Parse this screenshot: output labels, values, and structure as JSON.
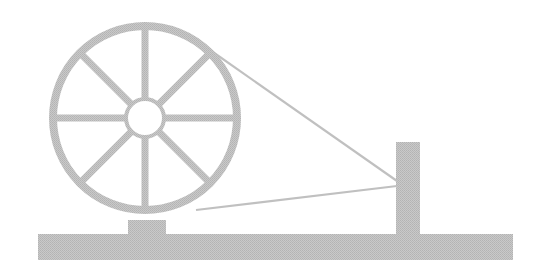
{
  "illustration": {
    "subject": "spinning wheel (charkha)",
    "colors": {
      "background": "#ffffff",
      "stroke": "#c4c4c4",
      "fill": "#bdbdbd",
      "hub_fill": "#ffffff"
    },
    "wheel": {
      "cx": 145,
      "cy": 118,
      "r": 92,
      "ring_width": 8,
      "hub_r": 19,
      "spokes": 8
    },
    "pedestal": {
      "x": 128,
      "y": 222,
      "w": 38,
      "h": 14
    },
    "base": {
      "x": 38,
      "y": 234,
      "w": 475,
      "h": 26
    },
    "post": {
      "x": 396,
      "y": 142,
      "w": 24,
      "h": 93
    },
    "strings": [
      {
        "x1": 210,
        "y1": 50,
        "x2": 397,
        "y2": 181
      },
      {
        "x1": 196,
        "y1": 210,
        "x2": 397,
        "y2": 186
      }
    ]
  }
}
